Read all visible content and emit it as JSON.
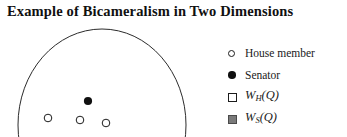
{
  "figure": {
    "title": "Example of Bicameralism in Two Dimensions",
    "width": 347,
    "height": 137,
    "background": "#ffffff"
  },
  "legend": {
    "position": "right",
    "entries": [
      {
        "marker": "circle-open",
        "label": "House member",
        "math": false
      },
      {
        "marker": "circle-filled",
        "label": "Senator",
        "math": false
      },
      {
        "marker": "square-open",
        "label": "W_H(Q)",
        "math": true,
        "base": "W",
        "sub": "H",
        "arg": "(Q)"
      },
      {
        "marker": "square-filled",
        "label": "W_S(Q)",
        "math": true,
        "base": "W",
        "sub": "S",
        "arg": "(Q)"
      }
    ]
  },
  "chart_data": {
    "type": "scatter",
    "title": "Example of Bicameralism in Two Dimensions",
    "xlabel": "",
    "ylabel": "",
    "grid": false,
    "axes_visible": false,
    "legend_position": "right",
    "colors": {
      "curve_stroke": "#2b2b2b",
      "point_open_stroke": "#1c1c1c",
      "point_filled_fill": "#101010",
      "square_open_stroke": "#1c1c1c",
      "square_filled_fill": "#7a7a7a",
      "background": "#ffffff",
      "title_color": "#101010"
    },
    "series": [
      {
        "name": "House member",
        "marker": "circle-open",
        "points": [
          {
            "x": 48,
            "y": 96
          },
          {
            "x": 80,
            "y": 98
          },
          {
            "x": 106,
            "y": 101
          }
        ]
      },
      {
        "name": "Senator",
        "marker": "circle-filled",
        "points": [
          {
            "x": 88,
            "y": 79
          }
        ]
      }
    ],
    "shapes": [
      {
        "name": "win-set-boundary",
        "type": "ellipse-arc",
        "cx": 102,
        "cy": 103,
        "rx": 84,
        "ry": 96,
        "stroke": "#2b2b2b",
        "stroke_width": 1,
        "fill": "none",
        "clipped_at_bottom": true
      }
    ]
  }
}
